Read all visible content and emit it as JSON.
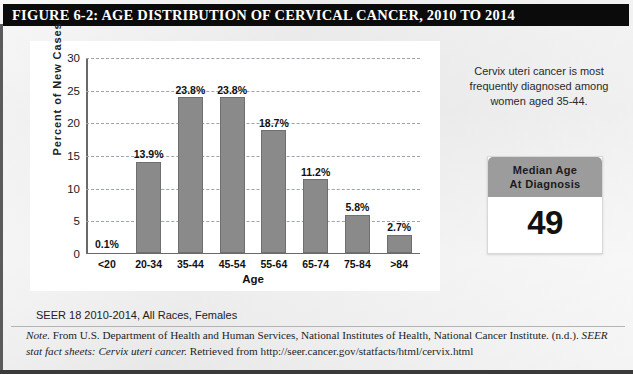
{
  "figure": {
    "title": "FIGURE 6-2: AGE DISTRIBUTION OF CERVICAL CANCER, 2010 TO 2014",
    "source_line": "SEER 18 2010-2014, All Races, Females",
    "note_label": "Note.",
    "note_text_1": " From U.S. Department of Health and Human Services, National Institutes of Health, National Cancer Institute. (n.d.). ",
    "note_italic_1": "SEER stat fact sheets:",
    "note_italic_2": "Cervix uteri cancer.",
    "note_text_2": " Retrieved from http://seer.cancer.gov/statfacts/html/cervix.html"
  },
  "side_panel": {
    "description": "Cervix uteri cancer is most frequently diagnosed among women aged 35-44.",
    "median_box_header_line1": "Median Age",
    "median_box_header_line2": "At Diagnosis",
    "median_value": "49"
  },
  "colors": {
    "title_bar": "#0b0b0b",
    "bar_fill": "#8a8a8a",
    "bar_edge": "#6f6f6f",
    "gridline": "#9aa3b0",
    "median_header": "#9c9c9c",
    "panel_background": "#ffffff"
  },
  "chart_data": {
    "type": "bar",
    "title": "",
    "xlabel": "Age",
    "ylabel": "Percent of New Cases",
    "categories": [
      "<20",
      "20-34",
      "35-44",
      "45-54",
      "55-64",
      "65-74",
      "75-84",
      ">84"
    ],
    "values": [
      0.1,
      13.9,
      23.8,
      23.8,
      18.7,
      11.2,
      5.8,
      2.7
    ],
    "data_labels": [
      "0.1%",
      "13.9%",
      "23.8%",
      "23.8%",
      "18.7%",
      "11.2%",
      "5.8%",
      "2.7%"
    ],
    "ylim": [
      0,
      30
    ],
    "yticks": [
      0,
      5,
      10,
      15,
      20,
      25,
      30
    ],
    "ytick_labels": [
      "0",
      "5",
      "10",
      "15",
      "20",
      "25",
      "30"
    ],
    "grid": true,
    "grid_style": "dashed-horizontal",
    "legend": false
  }
}
